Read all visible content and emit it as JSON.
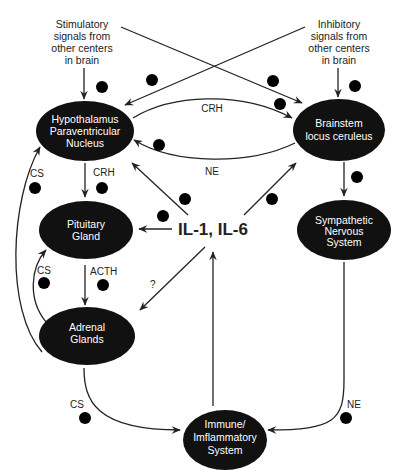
{
  "diagram": {
    "sources": {
      "stimulatory": [
        "Stimulatory",
        "signals from",
        "other centers",
        "in brain"
      ],
      "inhibitory": [
        "Inhibitory",
        "signals from",
        "other centers",
        "in brain"
      ]
    },
    "nodes": {
      "hypothalamus": [
        "Hypothalamus",
        "Paraventricular",
        "Nucleus"
      ],
      "brainstem": [
        "Brainstem",
        "locus ceruleus"
      ],
      "pituitary": [
        "Pituitary",
        "Gland"
      ],
      "sympathetic": [
        "Sympathetic",
        "Nervous",
        "System"
      ],
      "adrenal": [
        "Adrenal",
        "Glands"
      ],
      "immune": [
        "Immune/",
        "Imflammatory",
        "System"
      ],
      "cytokines": "IL-1, IL-6"
    },
    "edge_labels": {
      "crh_top": "CRH",
      "ne_loop": "NE",
      "crh_down": "CRH",
      "acth": "ACTH",
      "cs_hypo": "CS",
      "cs_pit": "CS",
      "cs_immune": "CS",
      "ne_immune": "NE",
      "unknown": "?"
    },
    "edges": [
      {
        "from": "stimulatory",
        "to": "hypothalamus",
        "sign": "+"
      },
      {
        "from": "stimulatory",
        "to": "brainstem",
        "sign": "+"
      },
      {
        "from": "inhibitory",
        "to": "hypothalamus",
        "sign": "-"
      },
      {
        "from": "inhibitory",
        "to": "brainstem",
        "sign": "-"
      },
      {
        "from": "hypothalamus",
        "to": "brainstem",
        "label": "CRH",
        "sign": "+"
      },
      {
        "from": "brainstem",
        "to": "hypothalamus",
        "label": "NE",
        "sign": "+"
      },
      {
        "from": "hypothalamus",
        "to": "pituitary",
        "label": "CRH",
        "sign": "+"
      },
      {
        "from": "pituitary",
        "to": "adrenal",
        "label": "ACTH",
        "sign": "+"
      },
      {
        "from": "adrenal",
        "to": "hypothalamus",
        "label": "CS",
        "sign": "-"
      },
      {
        "from": "adrenal",
        "to": "pituitary",
        "label": "CS",
        "sign": "-"
      },
      {
        "from": "brainstem",
        "to": "sympathetic",
        "sign": "+"
      },
      {
        "from": "cytokines",
        "to": "hypothalamus",
        "sign": "+"
      },
      {
        "from": "cytokines",
        "to": "pituitary",
        "sign": "+"
      },
      {
        "from": "cytokines",
        "to": "brainstem",
        "sign": "+"
      },
      {
        "from": "cytokines",
        "to": "adrenal",
        "label": "?"
      },
      {
        "from": "immune",
        "to": "cytokines"
      },
      {
        "from": "adrenal",
        "to": "immune",
        "label": "CS",
        "sign": "-"
      },
      {
        "from": "sympathetic",
        "to": "immune",
        "label": "NE",
        "sign": "-"
      }
    ],
    "colors": {
      "node_fill": "#111111",
      "node_text": "#ffffff",
      "line": "#222222",
      "background": "#ffffff"
    }
  }
}
